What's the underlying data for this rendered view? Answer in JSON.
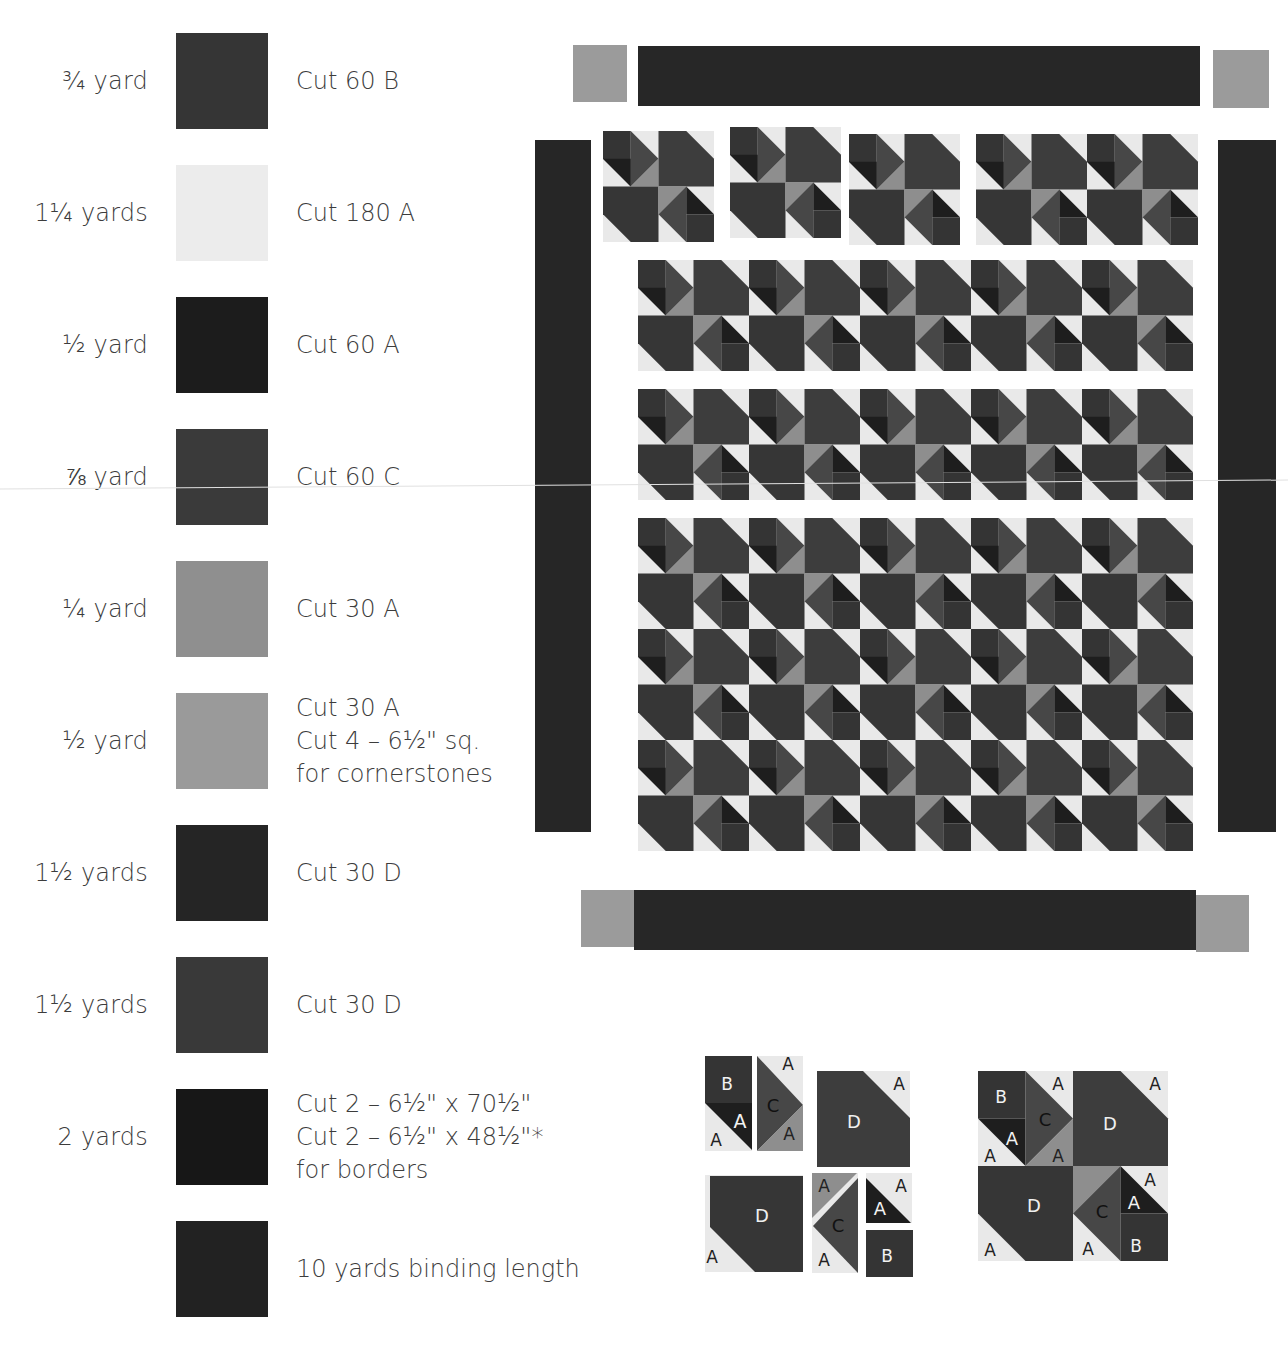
{
  "colors": {
    "A_light": "#e9e9e9",
    "A_dark": "#1e1e1e",
    "A_medium": "#8e8e8e",
    "B": "#343434",
    "C": "#474747",
    "D": "#363636",
    "D2": "#3d3d3d",
    "border": "#262626",
    "cornerstone": "#999999",
    "binding": "#2a2a2a"
  },
  "legend": [
    {
      "qty": "¾ yard",
      "cut": [
        "Cut 60 B"
      ],
      "swatch": "#353535"
    },
    {
      "qty": "1¼ yards",
      "cut": [
        "Cut 180 A"
      ],
      "swatch": "#ececec"
    },
    {
      "qty": "½ yard",
      "cut": [
        "Cut 60 A"
      ],
      "swatch": "#1c1c1c"
    },
    {
      "qty": "⅞ yard",
      "cut": [
        "Cut 60 C"
      ],
      "swatch": "#3a3a3a"
    },
    {
      "qty": "¼ yard",
      "cut": [
        "Cut 30 A"
      ],
      "swatch": "#8f8f8f"
    },
    {
      "qty": "½ yard",
      "cut": [
        "Cut 30 A",
        "Cut 4 – 6½\" sq.",
        "for cornerstones"
      ],
      "swatch": "#9a9a9a"
    },
    {
      "qty": "1½ yards",
      "cut": [
        "Cut 30 D"
      ],
      "swatch": "#252525"
    },
    {
      "qty": "1½ yards",
      "cut": [
        "Cut 30 D"
      ],
      "swatch": "#393939"
    },
    {
      "qty": "2 yards",
      "cut": [
        "Cut 2 – 6½\" x 70½\"",
        "Cut 2 – 6½\" x 48½\"*",
        "for borders"
      ],
      "swatch": "#171717"
    },
    {
      "qty": "",
      "cut": [
        "10 yards binding length"
      ],
      "swatch": "#222222"
    }
  ],
  "quilt": {
    "block_columns": 10,
    "block_rows": 6,
    "block_size_px": 111,
    "top_row_pieces": [
      2,
      2,
      2,
      4
    ]
  },
  "diagrams": {
    "exploded_labels": {
      "piece1": [
        "B",
        "A",
        "A"
      ],
      "piece2": [
        "C",
        "A",
        "A"
      ],
      "piece3": [
        "D",
        "A"
      ],
      "piece4": [
        "D",
        "A"
      ],
      "piece5": [
        "A",
        "C",
        "A"
      ],
      "piece6": [
        "A",
        "A",
        "B"
      ]
    },
    "assembled_labels": {
      "tl": [
        "B",
        "A",
        "A",
        "C",
        "A",
        "A"
      ],
      "tr": [
        "D",
        "A"
      ],
      "bl": [
        "D",
        "A"
      ],
      "br": [
        "C",
        "A",
        "A",
        "A",
        "B"
      ]
    }
  }
}
